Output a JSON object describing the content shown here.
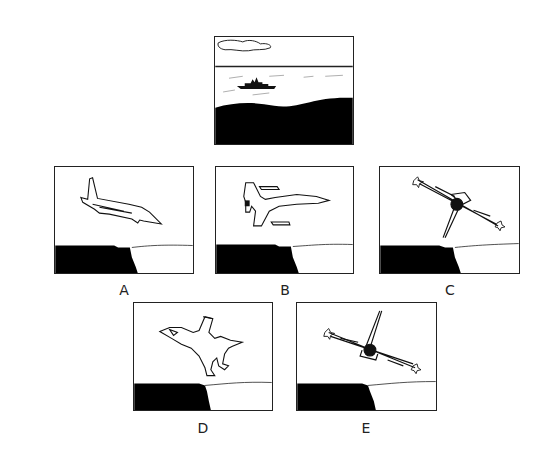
{
  "reference": {
    "description": "Ocean view from cockpit: cloud, horizon, warship, dark sea",
    "name": "reference-scene"
  },
  "options": [
    {
      "label": "A",
      "description": "Jet seen from left side, nose down, descending toward cliff"
    },
    {
      "label": "B",
      "description": "Jet seen from top, nose pointing right, level"
    },
    {
      "label": "C",
      "description": "Jet seen head-on from rear, banked, tail pointing down-left"
    },
    {
      "label": "D",
      "description": "Jet seen from top, nose pointing up-left, climbing"
    },
    {
      "label": "E",
      "description": "Jet seen head-on from rear, banked, tail pointing up"
    }
  ],
  "colors": {
    "ink": "#111111",
    "background": "#ffffff",
    "border": "#222222"
  }
}
